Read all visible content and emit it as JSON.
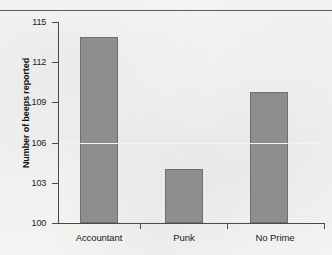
{
  "chart_data": {
    "type": "bar",
    "title": "",
    "xlabel": "",
    "ylabel": "Number of beeps reported",
    "categories": [
      "Accountant",
      "Punk",
      "No Prime"
    ],
    "values": [
      113.9,
      104.0,
      109.8
    ],
    "ylim": [
      100,
      115
    ],
    "yticks": [
      100,
      103,
      106,
      109,
      112,
      115
    ],
    "ytick_labels": [
      "100",
      "103",
      "106",
      "109",
      "112",
      "115"
    ],
    "grid": "single horizontal white line at 106",
    "legend": "none",
    "series": [
      {
        "name": "Number of beeps reported",
        "values": [
          113.9,
          104.0,
          109.8
        ]
      }
    ]
  },
  "style": {
    "bar_fill": "#8e8e8e",
    "bar_border": "#6f6f6f",
    "axis_color": "#4a4a4a",
    "text_color": "#1a1a1a",
    "background": "#f2f2f0",
    "gridline_color": "#f3f3f1"
  },
  "axis": {
    "y_label_text": "Number of beeps reported",
    "tick_100": "100",
    "tick_103": "103",
    "tick_106": "106",
    "tick_109": "109",
    "tick_112": "112",
    "tick_115": "115"
  },
  "categories_labels": {
    "cat0": "Accountant",
    "cat1": "Punk",
    "cat2": "No Prime"
  }
}
